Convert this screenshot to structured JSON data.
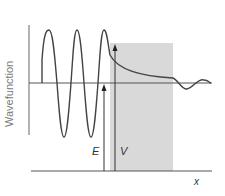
{
  "diagram": {
    "title": "",
    "y_axis_label": "Wavefunction",
    "x_axis_label": "x",
    "energy_label": "E",
    "barrier_label": "V",
    "colors": {
      "barrier": "#d9d9d9",
      "curve": "#444444",
      "axis": "#555555",
      "ylabel": "#7a7a7a"
    }
  }
}
